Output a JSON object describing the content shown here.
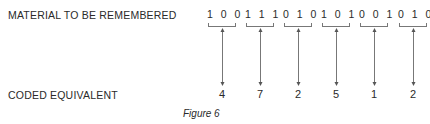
{
  "figure": {
    "row_labels": {
      "top": "MATERIAL TO BE REMEMBERED",
      "bottom": "CODED EQUIVALENT"
    },
    "groups": [
      {
        "bits": "100",
        "code": "4"
      },
      {
        "bits": "111",
        "code": "7"
      },
      {
        "bits": "010",
        "code": "2"
      },
      {
        "bits": "101",
        "code": "5"
      },
      {
        "bits": "001",
        "code": "1"
      },
      {
        "bits": "010",
        "code": "2"
      }
    ],
    "caption": "Figure 6",
    "connector": "double-headed-arrow",
    "colors": {
      "text": "#2a2a2a",
      "lines": "#777777",
      "background": "#ffffff"
    }
  }
}
